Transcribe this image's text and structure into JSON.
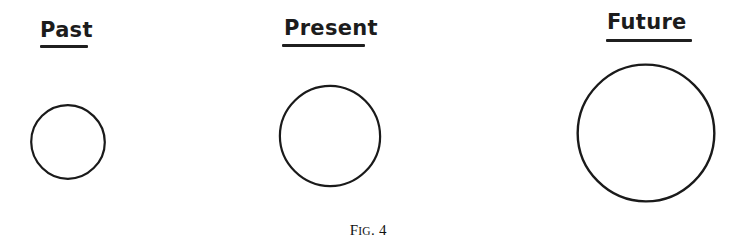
{
  "figure": {
    "caption_prefix": "F",
    "caption_small": "IG",
    "caption_dot": ".",
    "caption_number": "4",
    "caption_full": "FIG. 4",
    "background_color": "#ffffff",
    "ink_color": "#1a1a1a"
  },
  "groups": [
    {
      "id": "past",
      "label": "Past",
      "label_underlined": true,
      "shape": "circle",
      "circle_diameter_px": 80,
      "circle_center_x_px": 68,
      "circle_center_y_px": 142,
      "label_x_px": 40,
      "label_y_px": 20,
      "label_font_size_px": 21,
      "underline_x_px": 40,
      "underline_y_px": 45,
      "underline_width_px": 48,
      "underline_height_px": 3,
      "stroke_width_px": 2.2
    },
    {
      "id": "present",
      "label": "Present",
      "label_underlined": true,
      "shape": "circle",
      "circle_diameter_px": 108,
      "circle_center_x_px": 330,
      "circle_center_y_px": 136,
      "label_x_px": 284,
      "label_y_px": 18,
      "label_font_size_px": 21,
      "underline_x_px": 282,
      "underline_y_px": 44,
      "underline_width_px": 83,
      "underline_height_px": 3,
      "stroke_width_px": 2.2
    },
    {
      "id": "future",
      "label": "Future",
      "label_underlined": true,
      "shape": "circle",
      "circle_diameter_px": 146,
      "circle_center_x_px": 646,
      "circle_center_y_px": 133,
      "label_x_px": 607,
      "label_y_px": 12,
      "label_font_size_px": 21,
      "underline_x_px": 606,
      "underline_y_px": 39,
      "underline_width_px": 86,
      "underline_height_px": 3,
      "stroke_width_px": 2.4
    }
  ],
  "caption_position": {
    "y_px": 222
  }
}
